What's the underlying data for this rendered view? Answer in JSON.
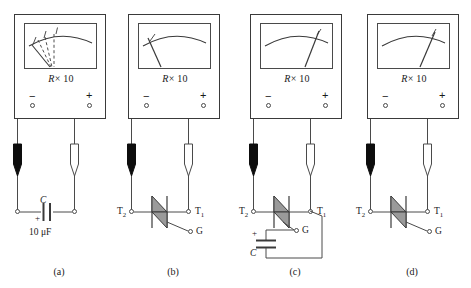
{
  "figure": {
    "title_fragment": "",
    "meter_range_prefix": "R",
    "meter_range_suffix": "× 10",
    "terminal_negative": "−",
    "terminal_positive": "+",
    "probe_negative_name": "black-probe",
    "probe_positive_name": "white-probe"
  },
  "panels": [
    {
      "id": "a",
      "caption": "(a)",
      "needle_state": "fluctuating",
      "needle_solid_angle_deg": -52,
      "needle_dashed_angles_deg": [
        -38,
        -30,
        -22
      ],
      "component": "capacitor",
      "component_label": "C",
      "component_value": "10 μF",
      "polarity_mark": "+",
      "left_terminal_label": "",
      "right_terminal_label": "",
      "gate_label": "",
      "gate_connected": false
    },
    {
      "id": "b",
      "caption": "(b)",
      "needle_state": "high-resistance",
      "needle_solid_angle_deg": -47,
      "needle_dashed_angles_deg": [],
      "component": "triac",
      "component_label": "",
      "component_value": "",
      "polarity_mark": "",
      "left_terminal_label": "T",
      "left_terminal_sub": "2",
      "right_terminal_label": "T",
      "right_terminal_sub": "1",
      "gate_label": "G",
      "gate_connected": false
    },
    {
      "id": "c",
      "caption": "(c)",
      "needle_state": "low-resistance",
      "needle_solid_angle_deg": 28,
      "needle_dashed_angles_deg": [],
      "component": "triac-with-capacitor",
      "component_label": "C",
      "component_value": "",
      "polarity_mark": "+",
      "left_terminal_label": "T",
      "left_terminal_sub": "2",
      "right_terminal_label": "T",
      "right_terminal_sub": "1",
      "gate_label": "G",
      "gate_connected": true
    },
    {
      "id": "d",
      "caption": "(d)",
      "needle_state": "low-resistance",
      "needle_solid_angle_deg": 26,
      "needle_dashed_angles_deg": [],
      "component": "triac",
      "component_label": "",
      "component_value": "",
      "polarity_mark": "",
      "left_terminal_label": "T",
      "left_terminal_sub": "2",
      "right_terminal_label": "T",
      "right_terminal_sub": "1",
      "gate_label": "G",
      "gate_connected": false
    }
  ],
  "colors": {
    "ink": "#3a3a3a",
    "line": "#4a4a4a",
    "probe_fill_black": "#0d0d0d",
    "probe_fill_white": "#ffffff",
    "background": "#ffffff"
  }
}
